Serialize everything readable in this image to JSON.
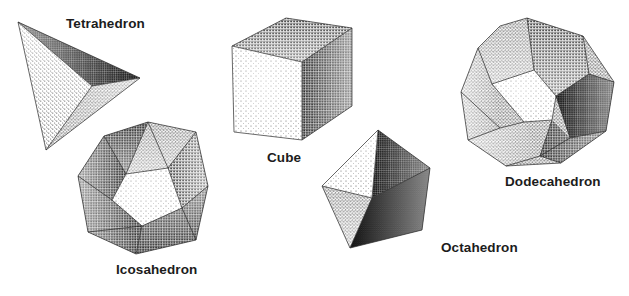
{
  "figure": {
    "background_color": "#ffffff",
    "render_style": "stippled pen-and-ink shading",
    "label_color": "#1c1c1c",
    "solids": [
      {
        "name": "tetrahedron",
        "label": "Tetrahedron",
        "faces": 4,
        "face_shape": "triangle",
        "label_position": {
          "x": 66,
          "y": 16
        },
        "visible_faces": [
          {
            "id": "tetra-face-left",
            "shade": "#f0f0f0",
            "stipple": "light"
          },
          {
            "id": "tetra-face-top",
            "shade": "#8f8f8f",
            "stipple": "dark"
          },
          {
            "id": "tetra-face-bottom",
            "shade": "#b8b8b8",
            "stipple": "medium"
          }
        ]
      },
      {
        "name": "cube",
        "label": "Cube",
        "faces": 6,
        "face_shape": "square",
        "label_position": {
          "x": 267,
          "y": 150
        },
        "visible_faces": [
          {
            "id": "cube-face-front",
            "shade": "#efefef",
            "stipple": "light"
          },
          {
            "id": "cube-face-top",
            "shade": "#a8a8a8",
            "stipple": "medium-dark"
          },
          {
            "id": "cube-face-right",
            "shade": "#8a8a8a",
            "stipple": "dark"
          }
        ]
      },
      {
        "name": "octahedron",
        "label": "Octahedron",
        "faces": 8,
        "face_shape": "triangle",
        "label_position": {
          "x": 441,
          "y": 240
        },
        "visible_faces": [
          {
            "id": "octa-face-upper-left",
            "shade": "#f2f2f2",
            "stipple": "light"
          },
          {
            "id": "octa-face-upper-right",
            "shade": "#9a9a9a",
            "stipple": "dark"
          },
          {
            "id": "octa-face-lower-left",
            "shade": "#b0b0b0",
            "stipple": "medium"
          },
          {
            "id": "octa-face-lower-right",
            "shade": "#7c7c7c",
            "stipple": "darkest"
          }
        ]
      },
      {
        "name": "dodecahedron",
        "label": "Dodecahedron",
        "faces": 12,
        "face_shape": "pentagon",
        "label_position": {
          "x": 505,
          "y": 174
        },
        "visible_faces": [
          {
            "id": "dodeca-face-center",
            "shade": "#f4f4f4",
            "stipple": "light"
          },
          {
            "id": "dodeca-face-top-left",
            "shade": "#bcbcbc",
            "stipple": "medium"
          },
          {
            "id": "dodeca-face-top-right",
            "shade": "#a2a2a2",
            "stipple": "medium-dark"
          },
          {
            "id": "dodeca-face-left",
            "shade": "#b4b4b4",
            "stipple": "medium"
          },
          {
            "id": "dodeca-face-right",
            "shade": "#868686",
            "stipple": "dark"
          },
          {
            "id": "dodeca-face-bottom-left",
            "shade": "#c4c4c4",
            "stipple": "medium-light"
          },
          {
            "id": "dodeca-face-bottom-right",
            "shade": "#8e8e8e",
            "stipple": "dark"
          }
        ]
      },
      {
        "name": "icosahedron",
        "label": "Icosahedron",
        "faces": 20,
        "face_shape": "triangle",
        "label_position": {
          "x": 116,
          "y": 262
        },
        "visible_faces": [
          {
            "id": "icosa-face-center",
            "shade": "#f1f1f1",
            "stipple": "light"
          },
          {
            "id": "icosa-face-upper",
            "shade": "#c0c0c0",
            "stipple": "medium"
          },
          {
            "id": "icosa-face-upper-left",
            "shade": "#a6a6a6",
            "stipple": "medium-dark"
          },
          {
            "id": "icosa-face-left",
            "shade": "#9c9c9c",
            "stipple": "dark"
          },
          {
            "id": "icosa-face-right",
            "shade": "#b6b6b6",
            "stipple": "medium"
          },
          {
            "id": "icosa-face-lower",
            "shade": "#a0a0a0",
            "stipple": "medium-dark"
          },
          {
            "id": "icosa-face-lower-left",
            "shade": "#8c8c8c",
            "stipple": "dark"
          }
        ]
      }
    ]
  }
}
